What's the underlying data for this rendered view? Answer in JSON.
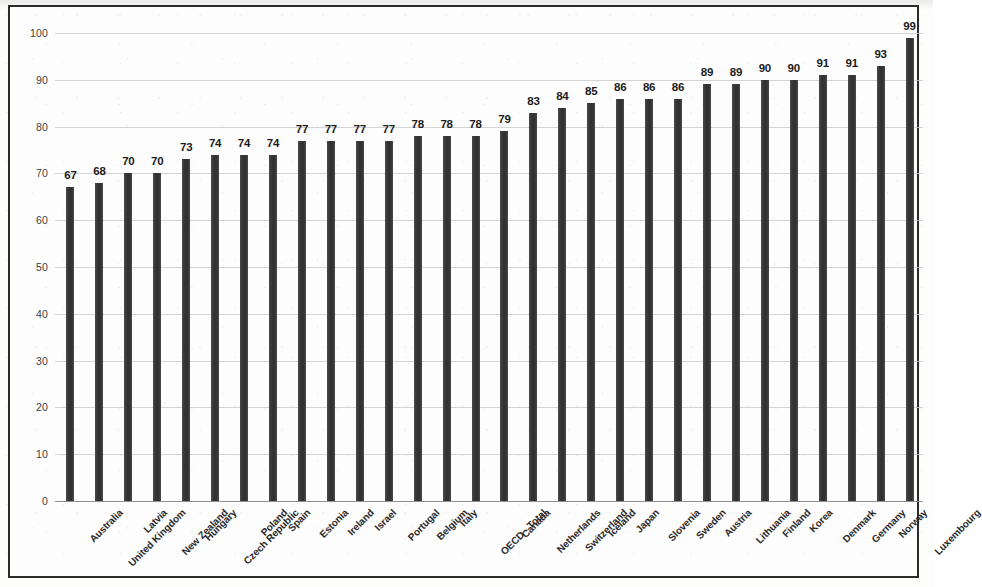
{
  "chart_data": {
    "type": "bar",
    "title": "",
    "subtitle": "",
    "xlabel": "",
    "ylabel": "",
    "ylim": [
      0,
      100
    ],
    "yticks": [
      0,
      10,
      20,
      30,
      40,
      50,
      60,
      70,
      80,
      90,
      100
    ],
    "grid": true,
    "legend": "none",
    "orientation": "vertical",
    "categories": [
      "Australia",
      "United Kingdom",
      "Latvia",
      "New Zealand",
      "Hungary",
      "Czech Republic",
      "Poland",
      "Spain",
      "Estonia",
      "Ireland",
      "Israel",
      "Portugal",
      "Belgium",
      "Italy",
      "OECD - Total",
      "Canada",
      "Netherlands",
      "Switzerland",
      "Iceland",
      "Japan",
      "Slovenia",
      "Sweden",
      "Austria",
      "Lithuania",
      "Finland",
      "Korea",
      "Denmark",
      "Germany",
      "Norway",
      "Luxembourg"
    ],
    "values": [
      67,
      68,
      70,
      70,
      73,
      74,
      74,
      74,
      77,
      77,
      77,
      77,
      78,
      78,
      78,
      79,
      83,
      84,
      85,
      86,
      86,
      86,
      89,
      89,
      90,
      90,
      91,
      91,
      93,
      99
    ],
    "data_labels": [
      "67",
      "68",
      "70",
      "70",
      "73",
      "74",
      "74",
      "74",
      "77",
      "77",
      "77",
      "77",
      "78",
      "78",
      "78",
      "79",
      "83",
      "84",
      "85",
      "86",
      "86",
      "86",
      "89",
      "89",
      "90",
      "90",
      "91",
      "91",
      "93",
      "99"
    ],
    "ytick_labels": [
      "0",
      "10",
      "20",
      "30",
      "40",
      "50",
      "60",
      "70",
      "80",
      "90",
      "100"
    ],
    "colors": {
      "bar": "#3b3b3b",
      "gridline": "#c9c9c9",
      "axis": "#8f8f8f",
      "frame": "#2b2b2b",
      "background": "#fdfdfd",
      "label_text": "#1c1c1c",
      "tick_text": "#3d3d3d"
    }
  }
}
